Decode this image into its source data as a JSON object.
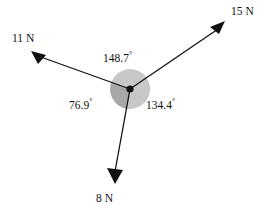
{
  "figure": {
    "type": "vector-force-diagram",
    "background_color": "#ffffff",
    "stroke_color": "#111111",
    "sector_dark_color": "#a8a8a8",
    "sector_light_color": "#c8c8c8",
    "origin": {
      "x": 130,
      "y": 89
    },
    "disc_radius": 20,
    "vectors": [
      {
        "label": "15 N",
        "magnitude": 15,
        "unit": "N",
        "direction_deg": 34.4,
        "tip": {
          "x": 225,
          "y": 24
        },
        "label_pos": {
          "x": 231,
          "y": 6
        }
      },
      {
        "label": "11 N",
        "magnitude": 11,
        "unit": "N",
        "direction_deg": 160.3,
        "tip": {
          "x": 32,
          "y": 54
        },
        "label_pos": {
          "x": 12,
          "y": 33
        }
      },
      {
        "label": "8 N",
        "magnitude": 8,
        "unit": "N",
        "direction_deg": -100.0,
        "tip": {
          "x": 113,
          "y": 183
        },
        "label_pos": {
          "x": 96,
          "y": 193
        }
      }
    ],
    "angles": [
      {
        "value": "148.7",
        "symbol": "°",
        "between": [
          "15 N",
          "11 N"
        ],
        "label_pos": {
          "x": 103,
          "y": 51
        }
      },
      {
        "value": "134.4",
        "symbol": "°",
        "between": [
          "15 N",
          "8 N"
        ],
        "label_pos": {
          "x": 146,
          "y": 98
        }
      },
      {
        "value": "76.9",
        "symbol": "°",
        "between": [
          "8 N",
          "11 N"
        ],
        "label_pos": {
          "x": 69,
          "y": 98
        }
      }
    ]
  }
}
